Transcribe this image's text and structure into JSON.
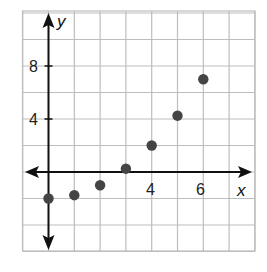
{
  "chart_data": {
    "type": "scatter",
    "title": "",
    "xlabel": "x",
    "ylabel": "y",
    "x_ticks_labeled": [
      4,
      6
    ],
    "y_ticks_labeled": [
      4,
      8
    ],
    "xlim": [
      -1,
      8
    ],
    "ylim": [
      -6,
      12
    ],
    "grid": true,
    "grid_step": {
      "x": 1,
      "y": 2
    },
    "points": [
      {
        "x": 0,
        "y": -2
      },
      {
        "x": 1,
        "y": -1.75
      },
      {
        "x": 2,
        "y": -1
      },
      {
        "x": 3,
        "y": 0.25
      },
      {
        "x": 4,
        "y": 2
      },
      {
        "x": 5,
        "y": 4.25
      },
      {
        "x": 6,
        "y": 7
      }
    ]
  },
  "labels": {
    "x_axis": "x",
    "y_axis": "y",
    "tick_x_4": "4",
    "tick_x_6": "6",
    "tick_y_4": "4",
    "tick_y_8": "8"
  },
  "colors": {
    "grid": "#bdbdbd",
    "axis": "#111111",
    "point": "#444444"
  }
}
